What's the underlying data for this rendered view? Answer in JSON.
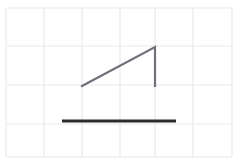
{
  "canvas": {
    "width": 240,
    "height": 163,
    "background_color": "#ffffff",
    "title": "Right triangle above a horizontal segment on graph paper"
  },
  "grid": {
    "name": "graph-paper-grid",
    "line_color": "#e9e9ec",
    "line_width": 1.2,
    "cell_width": 38,
    "cell_height": 39,
    "bounds": {
      "left": 6,
      "top": 8,
      "right": 232,
      "bottom": 157
    },
    "vertical_lines_x": [
      6,
      44,
      82,
      120,
      155,
      193,
      232
    ],
    "horizontal_lines_y": [
      8,
      46,
      85,
      124,
      157
    ]
  },
  "shapes": {
    "triangle": {
      "name": "right-triangle",
      "stroke_color": "#70707a",
      "stroke_width": 2.2,
      "fill": "none",
      "points": "82,86 155,47 155,86",
      "vertices": [
        {
          "label": "left-vertex",
          "x": 82,
          "y": 86
        },
        {
          "label": "apex-vertex",
          "x": 155,
          "y": 47
        },
        {
          "label": "right-angle-vertex",
          "x": 155,
          "y": 86
        }
      ],
      "edges": [
        {
          "label": "hypotenuse",
          "x1": 82,
          "y1": 86,
          "x2": 155,
          "y2": 47
        },
        {
          "label": "vertical-leg",
          "x1": 155,
          "y1": 47,
          "x2": 155,
          "y2": 86
        },
        {
          "label": "horizontal-leg",
          "x1": 155,
          "y1": 86,
          "x2": 82,
          "y2": 86
        }
      ]
    },
    "segment": {
      "name": "horizontal-segment",
      "stroke_color": "#2b2b2b",
      "stroke_width": 3,
      "x1": 62,
      "y1": 121,
      "x2": 176,
      "y2": 121,
      "length_px": 114
    }
  }
}
